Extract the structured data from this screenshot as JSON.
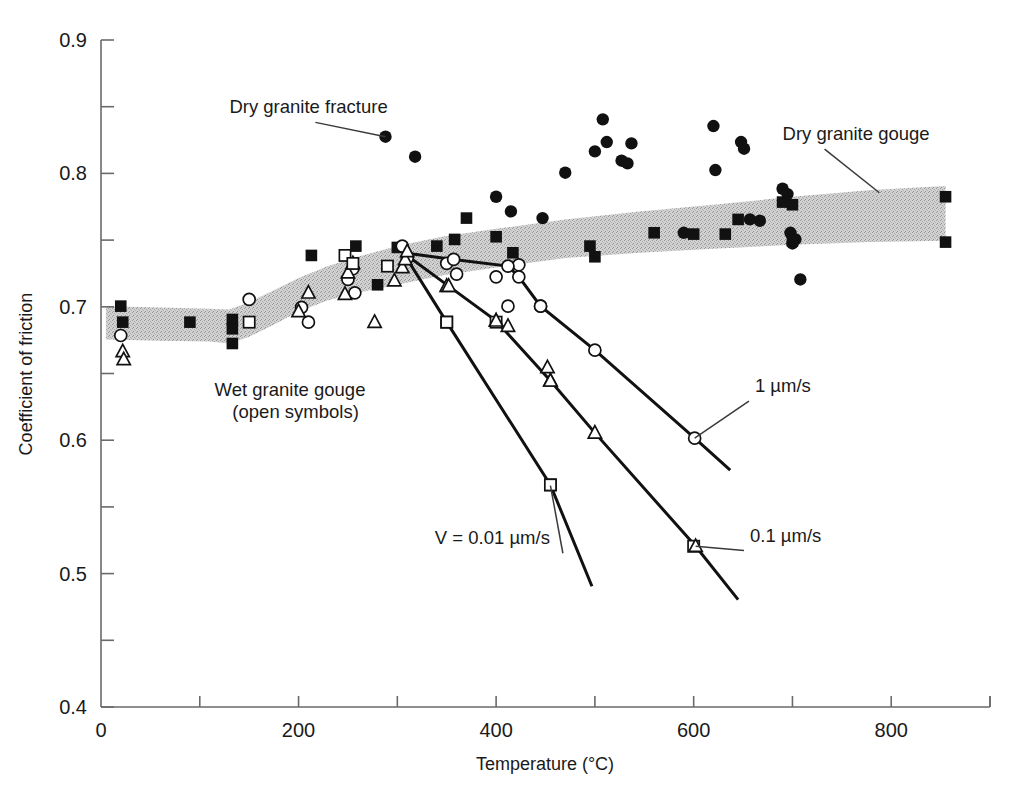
{
  "figure": {
    "background_color": "#ffffff",
    "band_fill_color": "#c9c9c9",
    "symbol_color": "#111111",
    "line_color": "#111111"
  },
  "chart_data": {
    "type": "scatter",
    "title": "",
    "xlabel": "Temperature (°C)",
    "ylabel": "Coefficient of friction",
    "xlim": [
      0,
      900
    ],
    "ylim": [
      0.4,
      0.9
    ],
    "grid": false,
    "legend_position": "in-plot annotations",
    "x_ticks_major": [
      0,
      200,
      400,
      600,
      800
    ],
    "x_ticks_major_labels": [
      "0",
      "200",
      "400",
      "600",
      "800"
    ],
    "x_ticks_minor": [
      100,
      300,
      500,
      700,
      900
    ],
    "y_ticks_major": [
      0.4,
      0.5,
      0.6,
      0.7,
      0.8,
      0.9
    ],
    "y_ticks_major_labels": [
      "0.4",
      "0.5",
      "0.6",
      "0.7",
      "0.8",
      "0.9"
    ],
    "y_ticks_minor": [
      0.45,
      0.55,
      0.65,
      0.75,
      0.85
    ],
    "annotations": [
      {
        "id": "dry-granite-fracture",
        "text": "Dry granite fracture",
        "text_x": 130,
        "text_y": 0.845,
        "leader_to_x": 288,
        "leader_to_y": 0.8275
      },
      {
        "id": "dry-granite-gouge",
        "text": "Dry granite gouge",
        "text_x": 690,
        "text_y": 0.825,
        "leader_to_x": 788,
        "leader_to_y": 0.7855
      },
      {
        "id": "wet-granite-gouge",
        "text": "Wet granite gouge",
        "text_x": 115,
        "text_y": 0.633,
        "leader_to_x": null,
        "leader_to_y": null
      },
      {
        "id": "wet-granite-gouge-sub",
        "text": "(open symbols)",
        "text_x": 133,
        "text_y": 0.617,
        "leader_to_x": null,
        "leader_to_y": null
      },
      {
        "id": "velocity-0p01",
        "text": "V = 0.01 µm/s",
        "text_x": 338,
        "text_y": 0.522,
        "leader_to_x": 455,
        "leader_to_y": 0.566
      },
      {
        "id": "velocity-0p1",
        "text": "0.1 µm/s",
        "text_x": 657,
        "text_y": 0.524,
        "leader_to_x": 602,
        "leader_to_y": 0.5205
      },
      {
        "id": "velocity-1",
        "text": "1 µm/s",
        "text_x": 662,
        "text_y": 0.636,
        "leader_to_x": 601,
        "leader_to_y": 0.6015
      }
    ],
    "bands": [
      {
        "name": "Dry granite gouge band",
        "fill": "#c9c9c9",
        "upper": [
          [
            5,
            0.7005
          ],
          [
            60,
            0.6995
          ],
          [
            110,
            0.6985
          ],
          [
            130,
            0.698
          ],
          [
            150,
            0.7035
          ],
          [
            175,
            0.7125
          ],
          [
            200,
            0.7215
          ],
          [
            230,
            0.7305
          ],
          [
            260,
            0.7375
          ],
          [
            300,
            0.7455
          ],
          [
            345,
            0.7525
          ],
          [
            400,
            0.7585
          ],
          [
            470,
            0.7655
          ],
          [
            545,
            0.7715
          ],
          [
            620,
            0.7765
          ],
          [
            700,
            0.7825
          ],
          [
            780,
            0.7875
          ],
          [
            855,
            0.7905
          ]
        ],
        "lower": [
          [
            5,
            0.6755
          ],
          [
            60,
            0.6745
          ],
          [
            110,
            0.674
          ],
          [
            130,
            0.6725
          ],
          [
            150,
            0.6775
          ],
          [
            175,
            0.6865
          ],
          [
            200,
            0.6965
          ],
          [
            230,
            0.705
          ],
          [
            260,
            0.7105
          ],
          [
            300,
            0.7165
          ],
          [
            345,
            0.7235
          ],
          [
            400,
            0.7295
          ],
          [
            470,
            0.7365
          ],
          [
            545,
            0.7405
          ],
          [
            620,
            0.7435
          ],
          [
            700,
            0.7465
          ],
          [
            780,
            0.7485
          ],
          [
            855,
            0.7495
          ]
        ]
      }
    ],
    "series": [
      {
        "name": "Dry granite fracture",
        "symbol": "filled-circle",
        "points": [
          [
            288,
            0.8275
          ],
          [
            318,
            0.8125
          ],
          [
            400,
            0.7825
          ],
          [
            415,
            0.7715
          ],
          [
            447,
            0.7665
          ],
          [
            470,
            0.8005
          ],
          [
            500,
            0.8165
          ],
          [
            508,
            0.8405
          ],
          [
            512,
            0.8235
          ],
          [
            527,
            0.8095
          ],
          [
            533,
            0.8075
          ],
          [
            537,
            0.8225
          ],
          [
            590,
            0.7555
          ],
          [
            620,
            0.8355
          ],
          [
            622,
            0.8025
          ],
          [
            648,
            0.8235
          ],
          [
            651,
            0.8185
          ],
          [
            657,
            0.7655
          ],
          [
            667,
            0.7645
          ],
          [
            690,
            0.7885
          ],
          [
            695,
            0.7845
          ],
          [
            698,
            0.7555
          ],
          [
            700,
            0.7475
          ],
          [
            703,
            0.7505
          ],
          [
            708,
            0.7205
          ]
        ]
      },
      {
        "name": "Dry granite gouge",
        "symbol": "filled-square",
        "points": [
          [
            20,
            0.7005
          ],
          [
            22,
            0.6885
          ],
          [
            90,
            0.6885
          ],
          [
            133,
            0.6905
          ],
          [
            133,
            0.6835
          ],
          [
            133,
            0.6725
          ],
          [
            213,
            0.7385
          ],
          [
            258,
            0.7455
          ],
          [
            280,
            0.7165
          ],
          [
            300,
            0.7445
          ],
          [
            340,
            0.7455
          ],
          [
            358,
            0.7505
          ],
          [
            370,
            0.7665
          ],
          [
            400,
            0.7525
          ],
          [
            417,
            0.7405
          ],
          [
            495,
            0.7455
          ],
          [
            500,
            0.7375
          ],
          [
            560,
            0.7555
          ],
          [
            600,
            0.7545
          ],
          [
            632,
            0.7545
          ],
          [
            645,
            0.7655
          ],
          [
            690,
            0.7785
          ],
          [
            700,
            0.7765
          ],
          [
            700,
            0.7495
          ],
          [
            855,
            0.7825
          ],
          [
            855,
            0.7485
          ]
        ]
      },
      {
        "name": "Wet granite gouge (circles)",
        "symbol": "open-circle",
        "points": [
          [
            20,
            0.6785
          ],
          [
            150,
            0.7055
          ],
          [
            203,
            0.6995
          ],
          [
            210,
            0.6885
          ],
          [
            250,
            0.7205
          ],
          [
            255,
            0.7285
          ],
          [
            257,
            0.7105
          ],
          [
            305,
            0.7455
          ],
          [
            310,
            0.7365
          ],
          [
            350,
            0.7325
          ],
          [
            360,
            0.7245
          ],
          [
            400,
            0.7225
          ],
          [
            412,
            0.7005
          ],
          [
            423,
            0.7315
          ],
          [
            445,
            0.7005
          ]
        ]
      },
      {
        "name": "Wet granite gouge (triangles)",
        "symbol": "open-triangle",
        "points": [
          [
            22,
            0.6665
          ],
          [
            23,
            0.6605
          ],
          [
            200,
            0.6965
          ],
          [
            210,
            0.7105
          ],
          [
            247,
            0.7095
          ],
          [
            250,
            0.7255
          ],
          [
            255,
            0.7325
          ],
          [
            277,
            0.6885
          ],
          [
            297,
            0.7195
          ],
          [
            305,
            0.7295
          ],
          [
            308,
            0.7355
          ],
          [
            310,
            0.7415
          ],
          [
            350,
            0.7155
          ],
          [
            400,
            0.6895
          ],
          [
            412,
            0.6855
          ],
          [
            455,
            0.6445
          ],
          [
            452,
            0.6545
          ]
        ]
      },
      {
        "name": "Wet granite gouge (squares)",
        "symbol": "open-square",
        "points": [
          [
            150,
            0.6885
          ],
          [
            247,
            0.7385
          ],
          [
            255,
            0.7325
          ],
          [
            290,
            0.7305
          ],
          [
            350,
            0.6885
          ],
          [
            400,
            0.6885
          ],
          [
            455,
            0.5665
          ],
          [
            600,
            0.5205
          ]
        ]
      }
    ],
    "curves": [
      {
        "name": "V = 0.01 µm/s",
        "symbol": "open-square",
        "points": [
          [
            306,
            0.7405
          ],
          [
            350,
            0.6885
          ],
          [
            455,
            0.5665
          ],
          [
            497,
            0.4905
          ]
        ]
      },
      {
        "name": "0.1 µm/s",
        "symbol": "open-triangle",
        "points": [
          [
            306,
            0.7405
          ],
          [
            352,
            0.7155
          ],
          [
            400,
            0.6895
          ],
          [
            455,
            0.6445
          ],
          [
            500,
            0.6055
          ],
          [
            602,
            0.5205
          ],
          [
            645,
            0.4805
          ]
        ]
      },
      {
        "name": "1 µm/s",
        "symbol": "open-circle",
        "points": [
          [
            306,
            0.7405
          ],
          [
            357,
            0.7355
          ],
          [
            412,
            0.7305
          ],
          [
            423,
            0.7225
          ],
          [
            445,
            0.7005
          ],
          [
            500,
            0.6675
          ],
          [
            601,
            0.6015
          ],
          [
            637,
            0.5775
          ]
        ]
      }
    ]
  }
}
